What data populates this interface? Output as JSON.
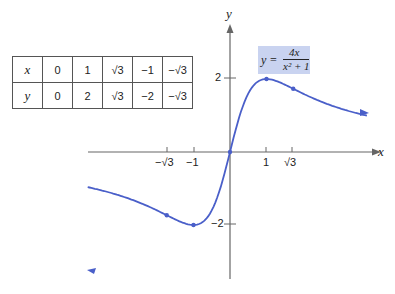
{
  "chart_data": {
    "type": "line",
    "title": "",
    "equation": "y = 4x / (x^2 + 1)",
    "xlabel": "x",
    "ylabel": "y",
    "x_ticks": [
      "−√3",
      "−1",
      "1",
      "√3"
    ],
    "y_ticks": [
      "2",
      "−2"
    ],
    "xlim": [
      -4,
      4.5
    ],
    "ylim": [
      -4.3,
      4.3
    ],
    "points": [
      {
        "x": 0,
        "y": 0
      },
      {
        "x": 1,
        "y": 2
      },
      {
        "x": 1.732,
        "y": 1.732
      },
      {
        "x": -1,
        "y": -2
      },
      {
        "x": -1.732,
        "y": -1.732
      }
    ],
    "table": {
      "rows": [
        {
          "label": "x",
          "values": [
            "0",
            "1",
            "√3",
            "−1",
            "−√3"
          ]
        },
        {
          "label": "y",
          "values": [
            "0",
            "2",
            "√3",
            "−2",
            "−√3"
          ]
        }
      ]
    },
    "line_color": "#4a5fc9",
    "highlight_color": "#c9d3f0"
  },
  "labels": {
    "x_axis": "x",
    "y_axis": "y",
    "tick_neg_sqrt3": "−√3",
    "tick_neg1": "−1",
    "tick_1": "1",
    "tick_sqrt3": "√3",
    "tick_y2": "2",
    "tick_yneg2": "−2",
    "formula_lhs": "y =",
    "formula_num": "4x",
    "formula_den": "x² + 1"
  }
}
